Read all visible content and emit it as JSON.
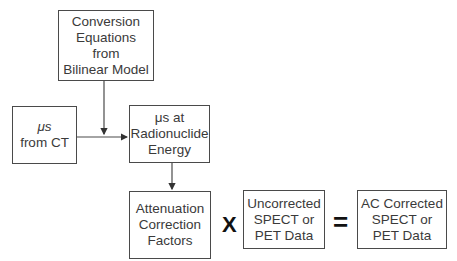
{
  "diagram": {
    "boxes": {
      "conversion": {
        "lines": [
          "Conversion",
          "Equations",
          "from",
          "Bilinear Model"
        ]
      },
      "mus_ct": {
        "lines": [
          "μs",
          "from CT"
        ]
      },
      "mus_energy": {
        "lines": [
          "μs at",
          "Radionuclide",
          "Energy"
        ]
      },
      "attenuation": {
        "lines": [
          "Attenuation",
          "Correction",
          "Factors"
        ]
      },
      "uncorrected": {
        "lines": [
          "Uncorrected",
          "SPECT or",
          "PET Data"
        ]
      },
      "corrected": {
        "lines": [
          "AC Corrected",
          "SPECT or",
          "PET Data"
        ]
      }
    },
    "operators": {
      "multiply": "X",
      "equals": "="
    },
    "colors": {
      "line": "#4a4a4a",
      "text": "#3a3a3a",
      "operator": "#111111"
    }
  }
}
